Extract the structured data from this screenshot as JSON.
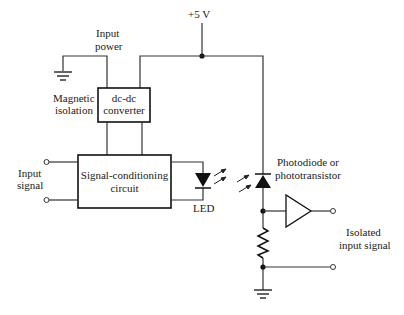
{
  "diagram": {
    "type": "circuit-schematic",
    "labels": {
      "supply": "+5 V",
      "input_power_1": "Input",
      "input_power_2": "power",
      "magnetic_1": "Magnetic",
      "magnetic_2": "isolation",
      "dcdc_1": "dc-dc",
      "dcdc_2": "converter",
      "input_signal_1": "Input",
      "input_signal_2": "signal",
      "sigcond_1": "Signal-conditioning",
      "sigcond_2": "circuit",
      "led": "LED",
      "photo_1": "Photodiode or",
      "photo_2": "phototransistor",
      "output_1": "Isolated",
      "output_2": "input signal"
    },
    "components": [
      "ground",
      "dc-dc converter",
      "signal-conditioning circuit",
      "LED",
      "photodiode",
      "buffer amplifier",
      "resistor",
      "ground"
    ],
    "colors": {
      "line": "#333333",
      "background": "#ffffff"
    }
  }
}
